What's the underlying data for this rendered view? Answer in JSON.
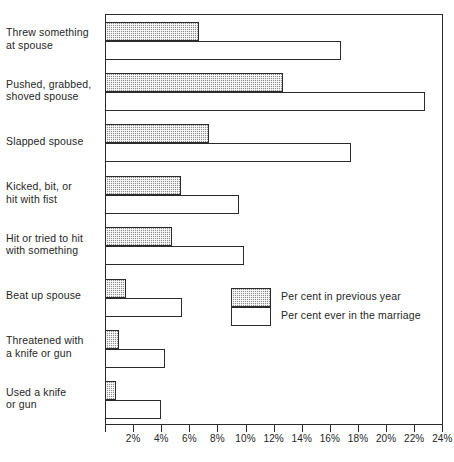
{
  "chart_data": {
    "type": "bar",
    "orientation": "horizontal",
    "title": "",
    "xlabel": "",
    "ylabel": "",
    "xlim": [
      0,
      24
    ],
    "xticks": [
      0,
      2,
      4,
      6,
      8,
      10,
      12,
      14,
      16,
      18,
      20,
      22,
      24
    ],
    "xtick_labels": [
      "",
      "2%",
      "4%",
      "6%",
      "8%",
      "10%",
      "12%",
      "14%",
      "16%",
      "18%",
      "20%",
      "22%",
      "24%"
    ],
    "grid": false,
    "legend_position": "center-right",
    "categories": [
      "Threw something at spouse",
      "Pushed, grabbed, shoved spouse",
      "Slapped spouse",
      "Kicked, bit, or hit with fist",
      "Hit or tried to hit with something",
      "Beat up spouse",
      "Threatened with a knife or gun",
      "Used a knife or gun"
    ],
    "category_lines": [
      [
        "Threw something",
        "at spouse"
      ],
      [
        "Pushed, grabbed,",
        "shoved spouse"
      ],
      [
        "Slapped spouse"
      ],
      [
        "Kicked, bit, or",
        "hit with fist"
      ],
      [
        "Hit or tried to hit",
        "with something"
      ],
      [
        "Beat up spouse"
      ],
      [
        "Threatened with",
        "a knife or gun"
      ],
      [
        "Used a knife",
        "or gun"
      ]
    ],
    "series": [
      {
        "name": "Per cent in previous year",
        "fill": "shaded",
        "color": "#8d8d8d",
        "values": [
          6.7,
          12.7,
          7.4,
          5.4,
          4.8,
          1.5,
          1.0,
          0.8
        ]
      },
      {
        "name": "Per cent ever in the marriage",
        "fill": "white",
        "color": "#ffffff",
        "values": [
          16.8,
          22.8,
          17.5,
          9.5,
          9.9,
          5.5,
          4.3,
          4.0
        ]
      }
    ]
  },
  "legend": {
    "items": [
      {
        "label": "Per cent in previous year"
      },
      {
        "label": "Per cent ever in the marriage"
      }
    ]
  },
  "colors": {
    "axis": "#2b2b2b",
    "text": "#262626",
    "shaded_series": "#8d8d8d",
    "background": "#ffffff"
  }
}
